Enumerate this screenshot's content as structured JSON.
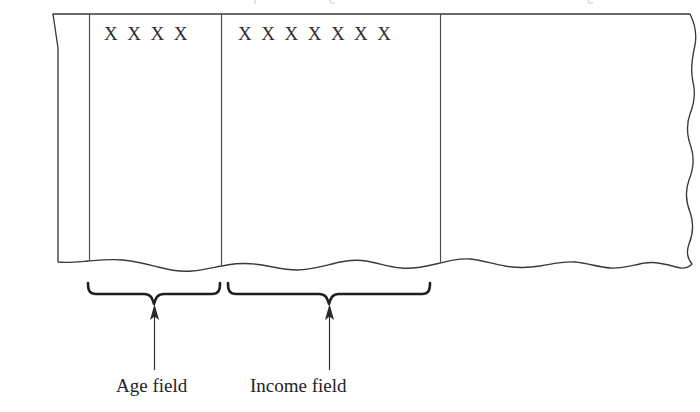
{
  "figure": {
    "card": {
      "punch_mark": "X",
      "ink_color": "#2e2e2e",
      "outline_color": "#3a3a3a",
      "divider_color": "#4a4a4a",
      "background_color": "#ffffff"
    },
    "fields": [
      {
        "id": "age",
        "label": "Age field",
        "punch_marks": "X  X  X  X",
        "column_count": 4,
        "brace_start_x": 88,
        "brace_end_x": 218,
        "arrow_x": 154
      },
      {
        "id": "income",
        "label": "Income field",
        "punch_marks": "X  X  X  X  X  X  X",
        "column_count": 7,
        "brace_start_x": 227,
        "brace_end_x": 430,
        "arrow_x": 329
      }
    ],
    "unlabeled_region": {
      "id": "remainder",
      "label": "",
      "description": "unpunched remainder of card to the right of the Income field"
    },
    "cropped_caption_fragment": ""
  }
}
